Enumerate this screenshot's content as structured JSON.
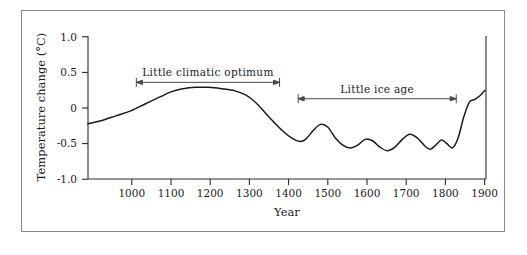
{
  "figure": {
    "background_color": "#ffffff",
    "frame_color": "#8a8a8a",
    "curve_color": "#1a1a1a",
    "axis_color": "#2b2b2b",
    "annotation_color": "#4a4a4a"
  },
  "chart_data": {
    "type": "line",
    "title": "",
    "xlabel": "Year",
    "ylabel": "Temperature change (°C)",
    "xlim": [
      885,
      1955
    ],
    "ylim": [
      -1.0,
      1.0
    ],
    "grid": false,
    "legend": "none",
    "x_ticks": [
      1000,
      1100,
      1200,
      1300,
      1400,
      1500,
      1600,
      1700,
      1800,
      1900
    ],
    "x_tick_labels": [
      "1000",
      "1100",
      "1200",
      "1300",
      "1400",
      "1500",
      "1600",
      "1700",
      "1800",
      "1900"
    ],
    "y_ticks": [
      -1.0,
      -0.5,
      0,
      0.5,
      1.0
    ],
    "y_tick_labels": [
      "-1.0",
      "-0.5",
      "0",
      "0.5",
      "1.0"
    ],
    "series": [
      {
        "name": "Temperature change",
        "x": [
          885,
          920,
          960,
          1000,
          1040,
          1080,
          1110,
          1140,
          1175,
          1210,
          1245,
          1280,
          1310,
          1335,
          1360,
          1385,
          1410,
          1435,
          1455,
          1470,
          1490,
          1510,
          1530,
          1550,
          1570,
          1590,
          1610,
          1630,
          1650,
          1670,
          1690,
          1710,
          1730,
          1750,
          1770,
          1790,
          1805,
          1820,
          1835,
          1850,
          1865,
          1880,
          1895,
          1910,
          1925,
          1940,
          1952
        ],
        "y": [
          -0.22,
          -0.18,
          -0.11,
          -0.04,
          0.06,
          0.16,
          0.23,
          0.27,
          0.29,
          0.29,
          0.27,
          0.24,
          0.18,
          0.08,
          -0.06,
          -0.2,
          -0.33,
          -0.43,
          -0.47,
          -0.44,
          -0.32,
          -0.23,
          -0.27,
          -0.42,
          -0.52,
          -0.56,
          -0.52,
          -0.44,
          -0.46,
          -0.55,
          -0.6,
          -0.55,
          -0.44,
          -0.37,
          -0.42,
          -0.53,
          -0.58,
          -0.52,
          -0.45,
          -0.5,
          -0.56,
          -0.42,
          -0.13,
          0.08,
          0.12,
          0.18,
          0.25
        ]
      }
    ],
    "annotations": [
      {
        "name": "little-climatic-optimum",
        "label": "Little  climatic  optimum",
        "x_start": 1015,
        "x_end": 1400,
        "y": 0.36,
        "style": "double-headed-arrow"
      },
      {
        "name": "little-ice-age",
        "label": "Little ice  age",
        "x_start": 1450,
        "x_end": 1875,
        "y": 0.13,
        "style": "double-headed-arrow"
      }
    ]
  }
}
